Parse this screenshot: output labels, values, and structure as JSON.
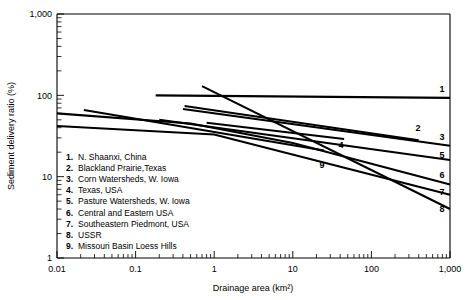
{
  "chart_data": {
    "type": "line",
    "title": "",
    "xlabel": "Drainage area (km²)",
    "ylabel": "Sediment delivery ratio (%)",
    "xscale": "log",
    "yscale": "log",
    "xlim": [
      0.01,
      1000
    ],
    "ylim": [
      1,
      1000
    ],
    "xticks": [
      "0.01",
      "0.1",
      "1",
      "10",
      "100",
      "1,000"
    ],
    "xtick_values": [
      0.01,
      0.1,
      1,
      10,
      100,
      1000
    ],
    "yticks": [
      "1",
      "10",
      "100",
      "1,000"
    ],
    "ytick_values": [
      1,
      10,
      100,
      1000
    ],
    "grid": false,
    "legend_position": "inside-lower-left",
    "series": [
      {
        "id": "1",
        "name": "N. Shaanxi, China",
        "points": [
          [
            0.18,
            100
          ],
          [
            1000,
            93
          ]
        ],
        "end_label": "1"
      },
      {
        "id": "2",
        "name": "Blackland Prairie,Texas",
        "points": [
          [
            0.42,
            74
          ],
          [
            400,
            28
          ]
        ],
        "end_label": "2"
      },
      {
        "id": "3",
        "name": "Corn Watersheds, W. Iowa",
        "points": [
          [
            0.4,
            68
          ],
          [
            1000,
            24
          ]
        ],
        "end_label": "3"
      },
      {
        "id": "4",
        "name": "Texas, USA",
        "points": [
          [
            0.8,
            46
          ],
          [
            45,
            29
          ]
        ],
        "end_label": "4"
      },
      {
        "id": "5",
        "name": "Pasture Watersheds, W. Iowa",
        "points": [
          [
            0.2,
            50
          ],
          [
            1000,
            16
          ]
        ],
        "end_label": "5"
      },
      {
        "id": "6",
        "name": "Central and Eastern USA",
        "points": [
          [
            0.01,
            60
          ],
          [
            0.5,
            45
          ],
          [
            10,
            26
          ],
          [
            1000,
            8
          ]
        ],
        "end_label": "6"
      },
      {
        "id": "7",
        "name": "Southeastern Piedmont, USA",
        "points": [
          [
            0.01,
            42
          ],
          [
            1,
            33
          ],
          [
            1000,
            6
          ]
        ],
        "end_label": "7"
      },
      {
        "id": "8",
        "name": "USSR",
        "points": [
          [
            0.7,
            130
          ],
          [
            1000,
            4
          ]
        ],
        "end_label": "8"
      },
      {
        "id": "9",
        "name": "Missouri Basin Loess Hills",
        "points": [
          [
            0.022,
            66
          ],
          [
            25,
            21
          ]
        ],
        "end_label": "9"
      }
    ],
    "legend_entries": [
      {
        "num": "1.",
        "label": "N. Shaanxi, China"
      },
      {
        "num": "2.",
        "label": "Blackland Prairie,Texas"
      },
      {
        "num": "3.",
        "label": "Corn Watersheds, W. Iowa"
      },
      {
        "num": "4.",
        "label": "Texas, USA"
      },
      {
        "num": "5.",
        "label": "Pasture Watersheds, W. Iowa"
      },
      {
        "num": "6.",
        "label": "Central and Eastern USA"
      },
      {
        "num": "7.",
        "label": "Southeastern Piedmont, USA"
      },
      {
        "num": "8.",
        "label": "USSR"
      },
      {
        "num": "9.",
        "label": "Missouri Basin Loess Hills"
      }
    ],
    "inline_labels": [
      {
        "text": "1",
        "x": 442,
        "y": 92
      },
      {
        "text": "2",
        "x": 418,
        "y": 131
      },
      {
        "text": "3",
        "x": 442,
        "y": 140
      },
      {
        "text": "4",
        "x": 341,
        "y": 148
      },
      {
        "text": "5",
        "x": 442,
        "y": 158
      },
      {
        "text": "6",
        "x": 442,
        "y": 178
      },
      {
        "text": "7",
        "x": 442,
        "y": 195
      },
      {
        "text": "8",
        "x": 442,
        "y": 212
      },
      {
        "text": "9",
        "x": 322,
        "y": 168
      }
    ],
    "colors": {
      "line": "#000000",
      "axis": "#000000",
      "background": "#ffffff"
    }
  }
}
